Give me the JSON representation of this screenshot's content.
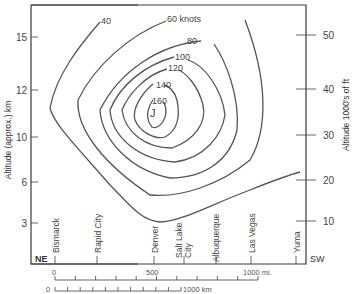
{
  "left_axis": {
    "label": "Altitude (approx.) km",
    "ticks": [
      "15",
      "12",
      "10",
      "6",
      "3"
    ]
  },
  "right_axis": {
    "label": "Altitude 1000's of ft",
    "ticks": [
      "50",
      "40",
      "30",
      "20",
      "10"
    ]
  },
  "contours": {
    "labels": [
      "40",
      "60 knots",
      "80",
      "100",
      "120",
      "140",
      "160"
    ],
    "core_symbol": "J"
  },
  "direction": {
    "left": "NE",
    "right": "SW"
  },
  "cities": [
    "Bismarck",
    "Rapid City",
    "Denver",
    "Salt Lake City",
    "Albuquerque",
    "Las Vegas",
    "Yuma"
  ],
  "city_lines": {
    "salt_lake_1": "Salt Lake",
    "salt_lake_2": "City"
  },
  "scale_miles": {
    "start": "0",
    "mid": "500",
    "end": "1000 mi."
  },
  "scale_km": {
    "start": "0",
    "end": "1000 km"
  }
}
